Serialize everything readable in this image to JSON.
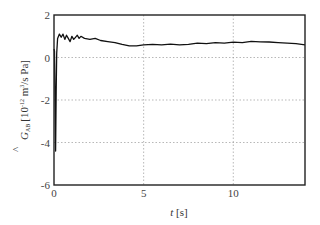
{
  "chart_data": {
    "type": "line",
    "title": "",
    "xlabel": "t [s]",
    "ylabel": "Ĝ_AB [10^-12 m^3/s Pa]",
    "ylabel_parts": {
      "hat_symbol": "^",
      "symbol": "G",
      "subscript": "AB",
      "unit_pre": "[10",
      "exponent": "-12",
      "unit_mid": " m",
      "unit_exp": "3",
      "unit_post": "/s Pa]"
    },
    "xlim": [
      0,
      14
    ],
    "ylim": [
      -6,
      2
    ],
    "xticks": [
      0,
      5,
      10
    ],
    "xtick_labels": [
      "0",
      "5",
      "10"
    ],
    "yticks": [
      2,
      0,
      -2,
      -4,
      -6
    ],
    "ytick_labels": [
      "2",
      "0",
      "-2",
      "-4",
      "-6"
    ],
    "grid": true,
    "grid_style": "dotted",
    "legend": null,
    "series": [
      {
        "name": "G_AB estimate",
        "color": "#111111",
        "x": [
          0.0,
          0.03,
          0.06,
          0.09,
          0.12,
          0.15,
          0.2,
          0.3,
          0.4,
          0.5,
          0.6,
          0.7,
          0.8,
          0.9,
          1.0,
          1.1,
          1.2,
          1.3,
          1.4,
          1.5,
          1.7,
          2.0,
          2.3,
          2.6,
          3.0,
          3.4,
          3.8,
          4.2,
          4.6,
          5.0,
          5.5,
          6.0,
          6.5,
          7.0,
          7.5,
          8.0,
          8.5,
          9.0,
          9.5,
          10.0,
          10.5,
          11.0,
          11.5,
          12.0,
          12.5,
          13.0,
          13.5,
          14.0
        ],
        "y": [
          0.4,
          0.3,
          -2.0,
          -4.4,
          -1.5,
          0.2,
          0.9,
          1.1,
          0.95,
          1.1,
          0.85,
          1.05,
          0.9,
          0.75,
          1.0,
          0.85,
          0.95,
          1.05,
          0.9,
          1.0,
          0.9,
          0.85,
          0.9,
          0.8,
          0.75,
          0.7,
          0.62,
          0.55,
          0.55,
          0.6,
          0.62,
          0.6,
          0.63,
          0.6,
          0.62,
          0.68,
          0.65,
          0.7,
          0.68,
          0.72,
          0.7,
          0.76,
          0.74,
          0.73,
          0.7,
          0.68,
          0.65,
          0.6
        ]
      }
    ]
  },
  "colors": {
    "line": "#111111",
    "axes": "#222222",
    "grid": "#999999",
    "background": "#ffffff"
  }
}
